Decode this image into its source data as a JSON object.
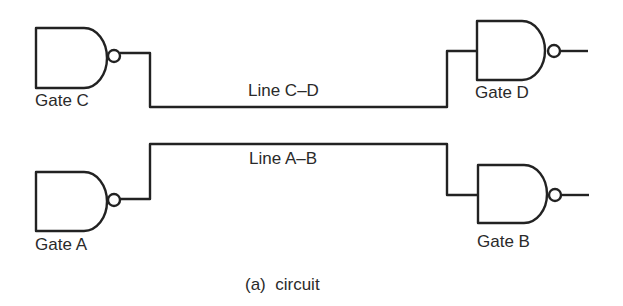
{
  "diagram": {
    "caption": "(a)  circuit",
    "gates": [
      {
        "id": "C",
        "type": "NAND",
        "label": "Gate C"
      },
      {
        "id": "D",
        "type": "NAND",
        "label": "Gate D"
      },
      {
        "id": "A",
        "type": "NAND",
        "label": "Gate A"
      },
      {
        "id": "B",
        "type": "NAND",
        "label": "Gate B"
      }
    ],
    "lines": [
      {
        "id": "C-D",
        "label": "Line C–D",
        "from": "C",
        "to": "D"
      },
      {
        "id": "A-B",
        "label": "Line A–B",
        "from": "A",
        "to": "B"
      }
    ],
    "stroke_color": "#222222"
  }
}
